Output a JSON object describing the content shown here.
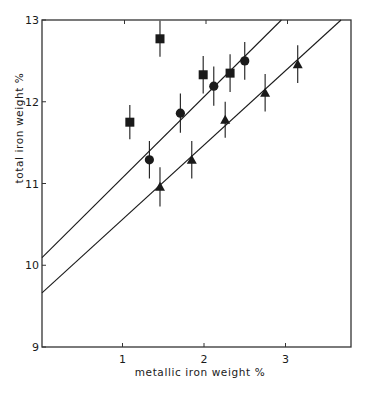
{
  "chart_data": {
    "type": "scatter",
    "title": "",
    "xlabel": "metallic iron weight %",
    "ylabel": "total iron weight %",
    "xlim": [
      0,
      3.8
    ],
    "ylim": [
      9,
      13
    ],
    "xticks": [
      1,
      2,
      3
    ],
    "yticks": [
      9,
      10,
      11,
      12,
      13
    ],
    "xtick_labels": [
      "1",
      "2",
      "3"
    ],
    "ytick_labels": [
      "9",
      "10",
      "11",
      "12",
      "13"
    ],
    "grid": false,
    "legend": null,
    "series": [
      {
        "name": "squares",
        "marker": "square",
        "points": [
          {
            "x": 1.09,
            "y": 11.75,
            "err": 0.21
          },
          {
            "x": 1.46,
            "y": 12.77,
            "err": 0.22
          },
          {
            "x": 1.99,
            "y": 12.33,
            "err": 0.23
          },
          {
            "x": 2.32,
            "y": 12.35,
            "err": 0.23
          }
        ]
      },
      {
        "name": "circles",
        "marker": "circle",
        "points": [
          {
            "x": 1.33,
            "y": 11.29,
            "err": 0.23
          },
          {
            "x": 1.71,
            "y": 11.86,
            "err": 0.24
          },
          {
            "x": 2.12,
            "y": 12.19,
            "err": 0.24
          },
          {
            "x": 2.5,
            "y": 12.5,
            "err": 0.23
          }
        ]
      },
      {
        "name": "triangles",
        "marker": "triangle",
        "points": [
          {
            "x": 1.46,
            "y": 10.96,
            "err": 0.24
          },
          {
            "x": 1.85,
            "y": 11.29,
            "err": 0.23
          },
          {
            "x": 2.26,
            "y": 11.78,
            "err": 0.22
          },
          {
            "x": 2.75,
            "y": 12.11,
            "err": 0.23
          },
          {
            "x": 3.15,
            "y": 12.46,
            "err": 0.23
          }
        ]
      }
    ],
    "lines": [
      {
        "name": "upper-fit-line",
        "intercept": 10.08,
        "slope": 0.99
      },
      {
        "name": "lower-fit-line",
        "intercept": 9.65,
        "slope": 0.91
      }
    ]
  },
  "style": {
    "ink": "#1a1a1a",
    "axis": "#333333",
    "background": "#ffffff"
  }
}
